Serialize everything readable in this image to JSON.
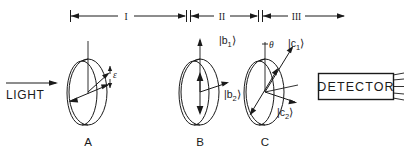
{
  "figure": {
    "background_color": "#ffffff",
    "ink_color": "#1a1a1a",
    "width": 404,
    "height": 157
  },
  "scale_bar": {
    "regions": [
      {
        "id": "I",
        "label": "I",
        "x_start": 70,
        "x_end": 186
      },
      {
        "id": "II",
        "label": "II",
        "x_start": 190,
        "x_end": 258
      },
      {
        "id": "III",
        "label": "III",
        "x_start": 262,
        "x_end": 345
      }
    ],
    "y": 16
  },
  "source": {
    "label": "LIGHT",
    "arrow_direction": "right"
  },
  "elements": [
    {
      "id": "A",
      "label": "A",
      "center_x": 88,
      "center_y": 92,
      "axis_label": "",
      "angle_label": "ε",
      "kets": []
    },
    {
      "id": "B",
      "label": "B",
      "center_x": 200,
      "center_y": 92,
      "angle_label": "",
      "kets": [
        {
          "base": "|b",
          "sub": "1",
          "close": "⟩",
          "direction": "vertical-up"
        },
        {
          "base": "|b",
          "sub": "2",
          "close": "⟩",
          "direction": "right-down"
        }
      ]
    },
    {
      "id": "C",
      "label": "C",
      "center_x": 265,
      "center_y": 92,
      "angle_label": "θ",
      "kets": [
        {
          "base": "|c",
          "sub": "1",
          "close": "⟩",
          "direction": "up-right"
        },
        {
          "base": "|c",
          "sub": "2",
          "close": "⟩",
          "direction": "right-down"
        }
      ]
    }
  ],
  "detector": {
    "label": "DETECTOR",
    "box": {
      "x": 318,
      "y": 73,
      "width": 76,
      "height": 26
    },
    "lead_count": 5
  }
}
